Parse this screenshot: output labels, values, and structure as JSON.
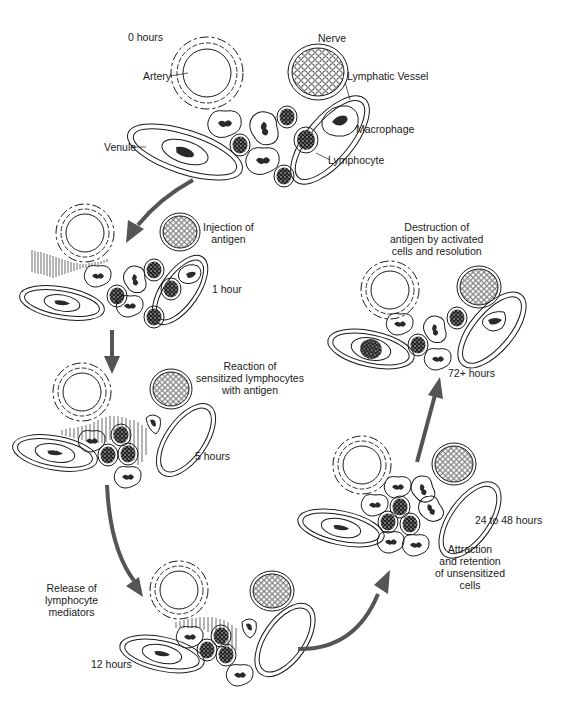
{
  "figure": {
    "colors": {
      "line": "#1a1a1a",
      "arrow": "#555555",
      "background": "#ffffff"
    },
    "anatomy_labels": {
      "artery": "Artery",
      "nerve": "Nerve",
      "lymphatic_vessel": "Lymphatic Vessel",
      "macrophage": "Macrophage",
      "lymphocyte": "Lymphocyte",
      "venule": "Venule"
    },
    "stages": [
      {
        "time": "0 hours",
        "description": ""
      },
      {
        "time": "1 hour",
        "description_lines": [
          "Injection of",
          "antigen"
        ]
      },
      {
        "time": "5 hours",
        "description_lines": [
          "Reaction of",
          "sensitized lymphocytes",
          "with antigen"
        ]
      },
      {
        "time": "12 hours",
        "description_lines": [
          "Release of",
          "lymphocyte",
          "mediators"
        ]
      },
      {
        "time": "24 to 48 hours",
        "description_lines": [
          "Attraction",
          "and retention",
          "of unsensitized",
          "cells"
        ]
      },
      {
        "time": "72+ hours",
        "description_lines": [
          "Destruction of",
          "antigen by activated",
          "cells and resolution"
        ]
      }
    ],
    "flow": [
      "0 hours",
      "1 hour",
      "5 hours",
      "12 hours",
      "24 to 48 hours",
      "72+ hours"
    ]
  }
}
